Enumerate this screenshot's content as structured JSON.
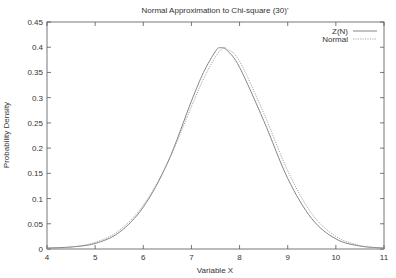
{
  "chart_data": {
    "type": "line",
    "title": "Normal Approximation to Chi-square (30)'",
    "xlabel": "Variable X",
    "ylabel": "Probability Density",
    "xlim": [
      4,
      11
    ],
    "ylim": [
      0,
      0.45
    ],
    "xticks": [
      "4",
      "5",
      "6",
      "7",
      "8",
      "9",
      "10",
      "11"
    ],
    "yticks": [
      "0",
      "0.05",
      "0.1",
      "0.15",
      "0.2",
      "0.25",
      "0.3",
      "0.35",
      "0.4",
      "0.45"
    ],
    "grid": false,
    "legend_position": "top-right",
    "series": [
      {
        "name": "Z(N)",
        "style": "solid",
        "x": [
          4.0,
          4.5,
          5.0,
          5.5,
          6.0,
          6.5,
          7.0,
          7.25,
          7.5,
          7.6,
          7.75,
          8.0,
          8.5,
          9.0,
          9.5,
          10.0,
          10.5,
          11.0
        ],
        "y": [
          0.002,
          0.004,
          0.011,
          0.033,
          0.083,
          0.17,
          0.293,
          0.35,
          0.392,
          0.399,
          0.393,
          0.36,
          0.255,
          0.14,
          0.06,
          0.02,
          0.006,
          0.002
        ]
      },
      {
        "name": "Normal",
        "style": "dotted",
        "x": [
          4.0,
          4.5,
          5.0,
          5.5,
          6.0,
          6.5,
          7.0,
          7.25,
          7.5,
          7.65,
          7.75,
          8.0,
          8.5,
          9.0,
          9.5,
          10.0,
          10.5,
          11.0
        ],
        "y": [
          0.001,
          0.004,
          0.013,
          0.037,
          0.087,
          0.17,
          0.282,
          0.337,
          0.381,
          0.398,
          0.396,
          0.372,
          0.27,
          0.155,
          0.07,
          0.025,
          0.007,
          0.001
        ]
      }
    ]
  }
}
